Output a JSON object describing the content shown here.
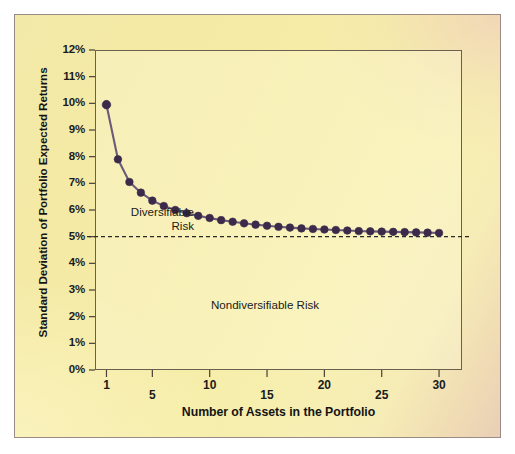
{
  "figure": {
    "background_color": "#f4eaa6",
    "frame_color": "#9c8a86",
    "plot_border_color": "#6b5f4e"
  },
  "chart_data": {
    "type": "line",
    "title": "",
    "subtitle": "",
    "xlabel": "Number of Assets in the Portfolio",
    "ylabel": "Standard Deviation of Portfolio Expected Returns",
    "xlim": [
      0,
      32
    ],
    "ylim": [
      0,
      12
    ],
    "grid": false,
    "legend": null,
    "legend_position": "none",
    "marker": "filled-circle",
    "marker_color": "#3b2a4a",
    "line_color": "#6b5b78",
    "x_ticks": [
      1,
      5,
      10,
      15,
      20,
      25,
      30
    ],
    "x_tick_labels": [
      "1",
      "5",
      "10",
      "15",
      "20",
      "25",
      "30"
    ],
    "y_ticks": [
      0,
      1,
      2,
      3,
      4,
      5,
      6,
      7,
      8,
      9,
      10,
      11,
      12
    ],
    "y_tick_labels": [
      "0%",
      "1%",
      "2%",
      "3%",
      "4%",
      "5%",
      "6%",
      "7%",
      "8%",
      "9%",
      "10%",
      "11%",
      "12%"
    ],
    "x": [
      1,
      2,
      3,
      4,
      5,
      6,
      7,
      8,
      9,
      10,
      11,
      12,
      13,
      14,
      15,
      16,
      17,
      18,
      19,
      20,
      21,
      22,
      23,
      24,
      25,
      26,
      27,
      28,
      29,
      30
    ],
    "values": [
      9.95,
      7.9,
      7.05,
      6.65,
      6.35,
      6.15,
      6.0,
      5.88,
      5.78,
      5.7,
      5.62,
      5.56,
      5.5,
      5.45,
      5.41,
      5.37,
      5.34,
      5.31,
      5.29,
      5.27,
      5.25,
      5.23,
      5.21,
      5.2,
      5.19,
      5.18,
      5.17,
      5.16,
      5.15,
      5.14
    ],
    "reference_line": {
      "name": "nondiversifiable-risk-level",
      "y": 5.0,
      "style": "dashed",
      "color": "#2a2a2a"
    },
    "annotations": [
      {
        "name": "diversifiable-risk-label",
        "text": "Diversifiable\nRisk",
        "x": 4.2,
        "y": 5.85
      },
      {
        "name": "nondiversifiable-risk-label",
        "text": "Nondiversifiable Risk",
        "x": 16.0,
        "y": 2.5
      }
    ]
  }
}
